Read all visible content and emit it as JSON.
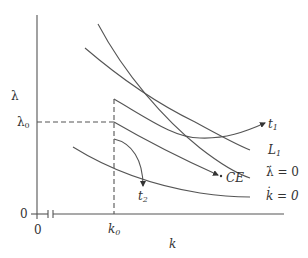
{
  "diagram": {
    "type": "phase diagram",
    "axes": {
      "y_label": "λ",
      "x_label": "k",
      "y_origin_label": "0",
      "x_origin_label": "0",
      "y_marker_label": "λ",
      "y_marker_sub": "0",
      "x_marker_label": "k",
      "x_marker_sub": "0"
    },
    "curves": [
      {
        "id": "lambda-dot-zero",
        "label": "λ̇ = 0",
        "label_main": "λ̇",
        "label_rest": " = 0"
      },
      {
        "id": "L1",
        "label": "L1",
        "label_main": "L",
        "label_sub": "1"
      },
      {
        "id": "t1-path",
        "label": "t1",
        "label_main": "t",
        "label_sub": "1"
      },
      {
        "id": "CE-path",
        "label": "CE"
      },
      {
        "id": "t2-path",
        "label": "t2",
        "label_main": "t",
        "label_sub": "2"
      },
      {
        "id": "k-dot-zero",
        "label": "k̇ = 0",
        "label_main": "k̇",
        "label_rest": " = 0"
      }
    ],
    "colors": {
      "line": "#444444",
      "text": "#333333",
      "background": "#ffffff"
    }
  }
}
